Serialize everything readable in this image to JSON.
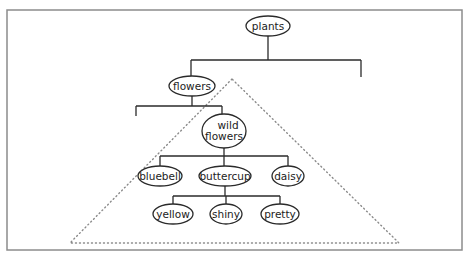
{
  "diagram": {
    "type": "tree",
    "frame": {
      "x": 7,
      "y": 10,
      "width": 455,
      "height": 240
    },
    "highlight_triangle": {
      "apex": [
        232,
        79
      ],
      "left": [
        70,
        243
      ],
      "right": [
        399,
        243
      ],
      "style": "dotted"
    },
    "nodes": [
      {
        "id": "plants",
        "label": "plants",
        "lines": [
          "plants"
        ],
        "cx": 268,
        "cy": 26,
        "rx": 22,
        "ry": 10
      },
      {
        "id": "flowers",
        "label": "flowers",
        "lines": [
          "flowers"
        ],
        "cx": 192,
        "cy": 86,
        "rx": 23,
        "ry": 10
      },
      {
        "id": "wild_flowers",
        "label": "wild flowers",
        "lines": [
          "wild",
          "flowers"
        ],
        "cx": 224,
        "cy": 131,
        "rx": 22,
        "ry": 17
      },
      {
        "id": "bluebell",
        "label": "bluebell",
        "lines": [
          "bluebell"
        ],
        "cx": 160,
        "cy": 176,
        "rx": 22,
        "ry": 10
      },
      {
        "id": "buttercup",
        "label": "buttercup",
        "lines": [
          "buttercup"
        ],
        "cx": 225,
        "cy": 176,
        "rx": 26,
        "ry": 10
      },
      {
        "id": "daisy",
        "label": "daisy",
        "lines": [
          "daisy"
        ],
        "cx": 288,
        "cy": 176,
        "rx": 16,
        "ry": 10
      },
      {
        "id": "yellow",
        "label": "yellow",
        "lines": [
          "yellow"
        ],
        "cx": 173,
        "cy": 214,
        "rx": 20,
        "ry": 10
      },
      {
        "id": "shiny",
        "label": "shiny",
        "lines": [
          "shiny"
        ],
        "cx": 226,
        "cy": 214,
        "rx": 16,
        "ry": 10
      },
      {
        "id": "pretty",
        "label": "pretty",
        "lines": [
          "pretty"
        ],
        "cx": 280,
        "cy": 214,
        "rx": 19,
        "ry": 10
      }
    ],
    "branches": [
      {
        "parent": "plants",
        "bar_y": 60,
        "parent_bottom": 36,
        "drops": [
          {
            "x": 191,
            "to": "flowers",
            "end_y": 76
          },
          {
            "x": 361,
            "to": null,
            "end_y": 77
          }
        ]
      },
      {
        "parent": "flowers",
        "bar_y": 106,
        "parent_bottom": 96,
        "drops": [
          {
            "x": 136,
            "to": null,
            "end_y": 116
          },
          {
            "x": 222,
            "to": "wild_flowers",
            "end_y": 114
          }
        ]
      },
      {
        "parent": "wild_flowers",
        "bar_y": 156,
        "parent_bottom": 148,
        "drops": [
          {
            "x": 160,
            "to": "bluebell",
            "end_y": 166
          },
          {
            "x": 224,
            "to": "buttercup",
            "end_y": 166
          },
          {
            "x": 288,
            "to": "daisy",
            "end_y": 166
          }
        ]
      },
      {
        "parent": "buttercup",
        "bar_y": 196,
        "parent_bottom": 186,
        "drops": [
          {
            "x": 173,
            "to": "yellow",
            "end_y": 204
          },
          {
            "x": 226,
            "to": "shiny",
            "end_y": 204
          },
          {
            "x": 280,
            "to": "pretty",
            "end_y": 204
          }
        ]
      }
    ]
  }
}
